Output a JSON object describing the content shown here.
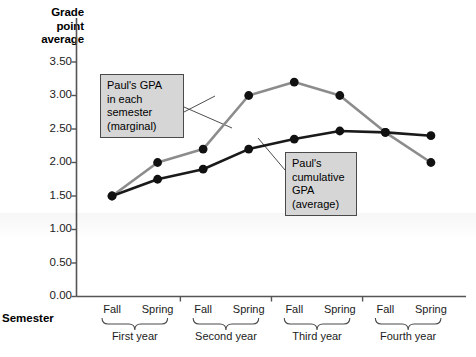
{
  "axes": {
    "y_title_lines": [
      "Grade",
      "point",
      "average"
    ],
    "x_title": "Semester",
    "y_ticks": [
      "0.00",
      "0.50",
      "1.00",
      "1.50",
      "2.00",
      "2.50",
      "3.00",
      "3.50"
    ],
    "x_ticks": [
      "Fall",
      "Spring",
      "Fall",
      "Spring",
      "Fall",
      "Spring",
      "Fall",
      "Spring"
    ],
    "year_groups": [
      "First year",
      "Second year",
      "Third year",
      "Fourth year"
    ]
  },
  "annotations": {
    "marginal": {
      "lines": [
        "Paul's GPA",
        "in each",
        "semester",
        "(marginal)"
      ]
    },
    "cumulative": {
      "lines": [
        "Paul's",
        "cumulative",
        "GPA",
        "(average)"
      ]
    }
  },
  "colors": {
    "marginal_line": "#8c8c8c",
    "cumulative_line": "#1a1a1a",
    "marker": "#111111",
    "axis": "#555555",
    "callout_fill": "#d6d6d6",
    "callout_border": "#4a4a4a"
  },
  "chart_data": {
    "type": "line",
    "title": "",
    "xlabel": "Semester",
    "ylabel": "Grade point average",
    "ylim": [
      0.0,
      3.5
    ],
    "grid": false,
    "legend_position": "annotations",
    "categories": [
      "Fall",
      "Spring",
      "Fall",
      "Spring",
      "Fall",
      "Spring",
      "Fall",
      "Spring"
    ],
    "category_groups": [
      "First year",
      "First year",
      "Second year",
      "Second year",
      "Third year",
      "Third year",
      "Fourth year",
      "Fourth year"
    ],
    "series": [
      {
        "name": "Paul's GPA in each semester (marginal)",
        "color": "#8c8c8c",
        "values": [
          1.5,
          2.0,
          2.2,
          3.0,
          3.2,
          3.0,
          2.45,
          2.0
        ]
      },
      {
        "name": "Paul's cumulative GPA (average)",
        "color": "#1a1a1a",
        "values": [
          1.5,
          1.75,
          1.9,
          2.2,
          2.35,
          2.47,
          2.45,
          2.4
        ]
      }
    ]
  }
}
